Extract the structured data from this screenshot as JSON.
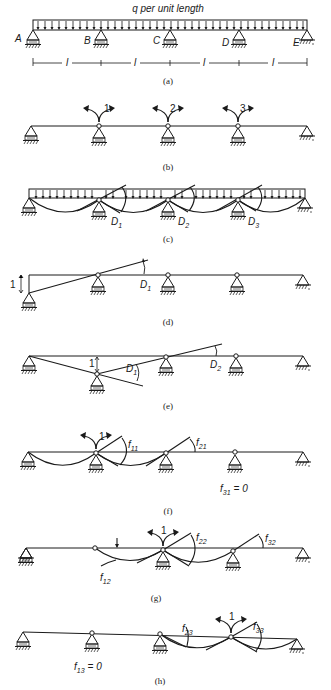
{
  "figure": {
    "load_label": "q per unit length",
    "support_labels": [
      "A",
      "B",
      "C",
      "D",
      "E"
    ],
    "span_label": "l",
    "span_count": 4,
    "panels": [
      {
        "id": "a",
        "caption": "(a)",
        "description": "Continuous beam ABCDE with uniform load q per unit length, four spans of length l"
      },
      {
        "id": "b",
        "caption": "(b)",
        "description": "Released structure with hinges at B, C, D; redundant moments 1, 2, 3",
        "moment_labels": [
          "1",
          "2",
          "3"
        ]
      },
      {
        "id": "c",
        "caption": "(c)",
        "description": "Released structure under load; rotation discontinuities",
        "angle_labels": [
          "D",
          "D",
          "D"
        ],
        "angle_subs": [
          "1",
          "2",
          "3"
        ]
      },
      {
        "id": "d",
        "caption": "(d)",
        "description": "Unit settlement at support A",
        "unit_label": "1",
        "angle_label": "D",
        "angle_sub": "1"
      },
      {
        "id": "e",
        "caption": "(e)",
        "description": "Unit settlement at support B",
        "unit_label": "1",
        "angle_labels": [
          "D",
          "D"
        ],
        "angle_subs": [
          "1",
          "2"
        ]
      },
      {
        "id": "f",
        "caption": "(f)",
        "description": "Unit moment at coordinate 1",
        "moment_label": "1",
        "flex_labels": [
          "f",
          "f"
        ],
        "flex_subs": [
          "11",
          "21"
        ],
        "zero_label": "f",
        "zero_sub": "31",
        "zero_value": "= 0"
      },
      {
        "id": "g",
        "caption": "(g)",
        "description": "Unit moment at coordinate 2",
        "moment_label": "1",
        "flex_labels": [
          "f",
          "f",
          "f"
        ],
        "flex_subs": [
          "12",
          "22",
          "32"
        ]
      },
      {
        "id": "h",
        "caption": "(h)",
        "description": "Unit moment at coordinate 3",
        "moment_label": "1",
        "flex_labels": [
          "f",
          "f"
        ],
        "flex_subs": [
          "23",
          "33"
        ],
        "zero_label": "f",
        "zero_sub": "13",
        "zero_value": "= 0"
      }
    ]
  }
}
